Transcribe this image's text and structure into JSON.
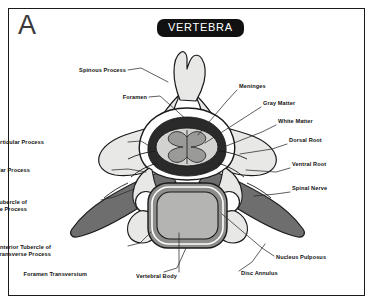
{
  "figure": {
    "panel_letter": "A",
    "title": "VERTEBRA",
    "badge_color": "#111111",
    "badge_text_color": "#ffffff",
    "border_color": "#1a1a1a",
    "background_color": "#ffffff"
  },
  "palette": {
    "bone_light": "#e8e8e6",
    "bone_mid": "#d8d8d6",
    "transverse_dark": "#6e6e6e",
    "disc_annulus": "#8d8d8b",
    "nucleus_pulposus": "#b4b4b2",
    "white_matter": "#d2d2d0",
    "gray_matter": "#9a9a98",
    "meninges": "#2a2a2a",
    "outline": "#1a1a1a",
    "leader_line": "#2a2a2a"
  },
  "labels": [
    {
      "id": "spinous-process",
      "text": "Spinous Process",
      "text2": "",
      "x": 126,
      "y": 71,
      "align": "r"
    },
    {
      "id": "foramen",
      "text": "Foramen",
      "text2": "",
      "x": 147,
      "y": 98,
      "align": "r"
    },
    {
      "id": "inferior-articular-process",
      "text": "Inferior Articular Process",
      "text2": "",
      "x": 44,
      "y": 143,
      "align": "r"
    },
    {
      "id": "superior-articular-process",
      "text": "Superior Articular Process",
      "text2": "",
      "x": 30,
      "y": 171,
      "align": "r"
    },
    {
      "id": "posterior-tubercle",
      "text": "Posterior Tubercle of",
      "text2": "Transverse Process",
      "x": 27,
      "y": 203,
      "align": "r"
    },
    {
      "id": "anterior-tubercle",
      "text": "Anterior Tubercle of",
      "text2": "Transverse Process",
      "x": 51,
      "y": 248,
      "align": "r"
    },
    {
      "id": "foramen-transversium",
      "text": "Foramen Transversium",
      "text2": "",
      "x": 87,
      "y": 275,
      "align": "r"
    },
    {
      "id": "vertebral-body",
      "text": "Vertebral Body",
      "text2": "",
      "x": 177,
      "y": 277,
      "align": "r"
    },
    {
      "id": "meninges",
      "text": "Meninges",
      "text2": "",
      "x": 239,
      "y": 87,
      "align": "l"
    },
    {
      "id": "gray-matter",
      "text": "Gray Matter",
      "text2": "",
      "x": 263,
      "y": 104,
      "align": "l"
    },
    {
      "id": "white-matter",
      "text": "White Matter",
      "text2": "",
      "x": 278,
      "y": 122,
      "align": "l"
    },
    {
      "id": "dorsal-root",
      "text": "Dorsal Root",
      "text2": "",
      "x": 289,
      "y": 141,
      "align": "l"
    },
    {
      "id": "ventral-root",
      "text": "Ventral Root",
      "text2": "",
      "x": 292,
      "y": 165,
      "align": "l"
    },
    {
      "id": "spinal-nerve",
      "text": "Spinal Nerve",
      "text2": "",
      "x": 292,
      "y": 189,
      "align": "l"
    },
    {
      "id": "nucleus-pulposus",
      "text": "Nucleus Pulposus",
      "text2": "",
      "x": 276,
      "y": 258,
      "align": "l"
    },
    {
      "id": "disc-annulus",
      "text": "Disc Annulus",
      "text2": "",
      "x": 241,
      "y": 274,
      "align": "l"
    }
  ],
  "leader_lines": [
    {
      "id": "spinous-process-leader",
      "points": "128,70 141,68 168,82"
    },
    {
      "id": "foramen-leader",
      "points": "149,97 160,96 187,120"
    },
    {
      "id": "inferior-articular-process-leader",
      "points": "128,142 141,141 156,150"
    },
    {
      "id": "superior-articular-process-leader",
      "points": "112,170 128,169 146,172"
    },
    {
      "id": "posterior-tubercle-leader",
      "points": "101,200 114,197 134,189"
    },
    {
      "id": "anterior-tubercle-leader",
      "points": "128,246 140,243 151,232"
    },
    {
      "id": "foramen-transversium-leader",
      "points": "164,272 177,268 186,248"
    },
    {
      "id": "vertebral-body-leader",
      "points": "179,272 179,259 179,233"
    },
    {
      "id": "meninges-leader",
      "points": "237,90 226,102 198,135"
    },
    {
      "id": "gray-matter-leader",
      "points": "261,107 247,116 205,143"
    },
    {
      "id": "white-matter-leader",
      "points": "276,125 262,132 221,148"
    },
    {
      "id": "dorsal-root-leader",
      "points": "287,144 272,149 240,154"
    },
    {
      "id": "ventral-root-leader",
      "points": "290,168 276,172 246,170"
    },
    {
      "id": "spinal-nerve-leader",
      "points": "290,192 276,194 254,196"
    },
    {
      "id": "nucleus-pulposus-leader",
      "points": "274,256 262,248 222,214"
    },
    {
      "id": "disc-annulus-leader",
      "points": "239,271 252,262 265,244"
    }
  ]
}
